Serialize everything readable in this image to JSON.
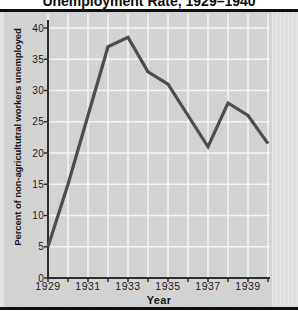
{
  "title": "Unemployment Rate, 1929–1940",
  "colors": {
    "panel_bg": "#d2d2d2",
    "panel_edge": "#dedede",
    "gridline": "#f4f4f4",
    "axis": "#2e2e2e",
    "line": "#4d4d4d",
    "rule": "#101010",
    "text": "#151515"
  },
  "chart_data": {
    "type": "line",
    "title": "Unemployment Rate, 1929–1940",
    "xlabel": "Year",
    "ylabel": "Percent of non-agricultutral workers unemployed",
    "x": [
      1929,
      1930,
      1931,
      1932,
      1933,
      1934,
      1935,
      1936,
      1937,
      1938,
      1939,
      1940
    ],
    "values": [
      5,
      15,
      26,
      37,
      38.5,
      33,
      31,
      26,
      21,
      28,
      26,
      21.5
    ],
    "xlim": [
      1929,
      1940
    ],
    "ylim": [
      0,
      40
    ],
    "x_tick_labels": [
      "1929",
      "1931",
      "1933",
      "1935",
      "1937",
      "1939"
    ],
    "y_ticks": [
      0,
      5,
      10,
      15,
      20,
      25,
      30,
      35,
      40
    ],
    "grid": true,
    "legend": "none",
    "line_color": "#4d4d4d",
    "gridline_color": "#f4f4f4"
  }
}
